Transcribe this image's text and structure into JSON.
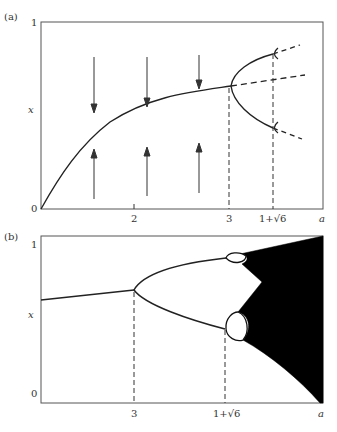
{
  "figure": {
    "panels": [
      {
        "id": "a",
        "label": "(a)",
        "y_axis": {
          "label": "x",
          "ticks": [
            "0",
            "1"
          ]
        },
        "x_axis": {
          "label": "a",
          "ticks": [
            "2",
            "3",
            "1+√6"
          ]
        },
        "description": "Fixed point x* = 1 - 1/a, stable until a = 3 where it becomes unstable (dashed) and a stable period-2 cycle branches off; the 2-cycle loses stability at a = 1+√6 (dashed continuation). Vertical arrows indicate attraction toward the stable fixed point."
      },
      {
        "id": "b",
        "label": "(b)",
        "y_axis": {
          "label": "x",
          "ticks": [
            "0",
            "1"
          ]
        },
        "x_axis": {
          "label": "a",
          "ticks": [
            "3",
            "1+√6"
          ]
        },
        "description": "Bifurcation diagram of the logistic map showing period-doubling at a = 3 and a = 1+√6, followed by the chaotic region (filled black) up to a = 4."
      }
    ],
    "colors": {
      "ink": "#333333",
      "fill": "#000000",
      "background": "#ffffff"
    }
  }
}
